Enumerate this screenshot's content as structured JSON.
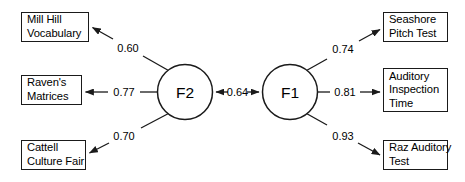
{
  "diagram": {
    "type": "path-diagram",
    "factors": [
      {
        "id": "F2",
        "label": "F2",
        "cx": 185,
        "cy": 92,
        "r": 27.5
      },
      {
        "id": "F1",
        "label": "F1",
        "cx": 290,
        "cy": 92,
        "r": 27.5
      }
    ],
    "indicators": [
      {
        "id": "mill-hill-vocabulary",
        "lines": [
          "Mill Hill",
          "Vocabulary"
        ],
        "x": 21,
        "y": 12,
        "w": 68,
        "h": 30,
        "side": "left"
      },
      {
        "id": "ravens-matrices",
        "lines": [
          "Raven's",
          "Matrices"
        ],
        "x": 21,
        "y": 75,
        "w": 61,
        "h": 30,
        "side": "left"
      },
      {
        "id": "cattell-culture-fair",
        "lines": [
          "Cattell",
          "Culture Fair"
        ],
        "x": 21,
        "y": 140,
        "w": 65,
        "h": 30,
        "side": "left"
      },
      {
        "id": "seashore-pitch-test",
        "lines": [
          "Seashore",
          "Pitch Test"
        ],
        "x": 383,
        "y": 12,
        "w": 65,
        "h": 30,
        "side": "right"
      },
      {
        "id": "auditory-inspection-time",
        "lines": [
          "Auditory",
          "Inspection",
          "Time"
        ],
        "x": 383,
        "y": 68,
        "w": 65,
        "h": 44,
        "side": "right"
      },
      {
        "id": "raz-auditory-test",
        "lines": [
          "Raz Auditory",
          "Test"
        ],
        "x": 383,
        "y": 140,
        "w": 65,
        "h": 30,
        "side": "right"
      }
    ],
    "paths": [
      {
        "id": "f2-to-mill-hill",
        "from": "F2",
        "to": "mill-hill-vocabulary",
        "coefficient": "0.60",
        "arrow": "single",
        "label_x": 128,
        "label_y": 48
      },
      {
        "id": "f2-to-ravens",
        "from": "F2",
        "to": "ravens-matrices",
        "coefficient": "0.77",
        "arrow": "single",
        "label_x": 124,
        "label_y": 92
      },
      {
        "id": "f2-to-cattell",
        "from": "F2",
        "to": "cattell-culture-fair",
        "coefficient": "0.70",
        "arrow": "single",
        "label_x": 124,
        "label_y": 136
      },
      {
        "id": "f2-to-f1-correlation",
        "from": "F2",
        "to": "F1",
        "coefficient": "0.64",
        "arrow": "double",
        "label_x": 237.5,
        "label_y": 92
      },
      {
        "id": "f1-to-seashore",
        "from": "F1",
        "to": "seashore-pitch-test",
        "coefficient": "0.74",
        "arrow": "single",
        "label_x": 343,
        "label_y": 48
      },
      {
        "id": "f1-to-auditory-inspection",
        "from": "F1",
        "to": "auditory-inspection-time",
        "coefficient": "0.81",
        "arrow": "single",
        "label_x": 345,
        "label_y": 92
      },
      {
        "id": "f1-to-raz",
        "from": "F1",
        "to": "raz-auditory-test",
        "coefficient": "0.93",
        "arrow": "single",
        "label_x": 343,
        "label_y": 136
      }
    ]
  }
}
